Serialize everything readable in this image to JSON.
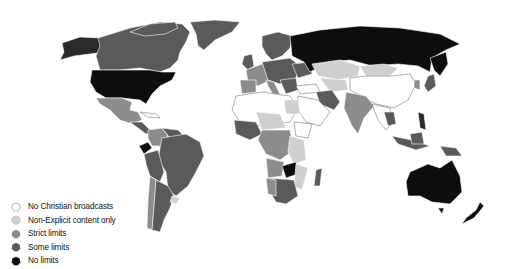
{
  "map": {
    "type": "world-choropleth",
    "colors": {
      "none": "#ffffff",
      "non_explicit": "#cfcfcf",
      "strict": "#8c8c8c",
      "some": "#5a5a5a",
      "no_limits": "#0d0d0d",
      "border": "#9a9a9a"
    }
  },
  "legend": {
    "items": [
      {
        "label": "No Christian broadcasts",
        "key": "none",
        "color": "#ffffff",
        "icon": "heptagon-outline-icon"
      },
      {
        "label": "Non-Explicit content only",
        "key": "non_explicit",
        "color": "#cfcfcf",
        "icon": "heptagon-icon"
      },
      {
        "label": "Strict limits",
        "key": "strict",
        "color": "#8c8c8c",
        "icon": "heptagon-icon"
      },
      {
        "label": "Some limits",
        "key": "some",
        "color": "#5a5a5a",
        "icon": "heptagon-icon"
      },
      {
        "label": "No limits",
        "key": "no_limits",
        "color": "#0d0d0d",
        "icon": "heptagon-icon"
      }
    ]
  }
}
